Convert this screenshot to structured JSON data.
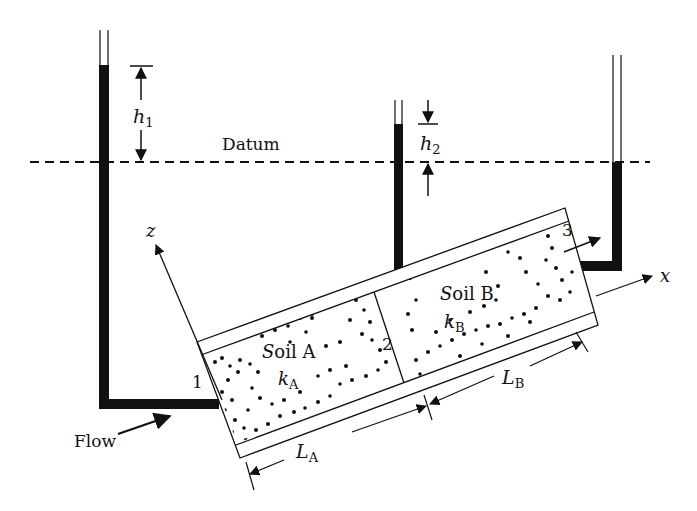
{
  "diagram": {
    "labels": {
      "datum": "Datum",
      "h1": "h",
      "h1_sub": "1",
      "h2": "h",
      "h2_sub": "2",
      "point1": "1",
      "point2": "2",
      "point3": "3",
      "z_axis": "z",
      "x_axis": "x",
      "flow": "Flow",
      "soilA_S": "S",
      "soilA_rest": "oil A",
      "kA": "k",
      "kA_sub": "A",
      "soilB_S": "S",
      "soilB_rest": "oil B",
      "kB": "k",
      "kB_sub": "B",
      "LA": "L",
      "LA_sub": "A",
      "LB": "L",
      "LB_sub": "B"
    },
    "colors": {
      "ink": "#111111",
      "background": "#ffffff"
    }
  }
}
